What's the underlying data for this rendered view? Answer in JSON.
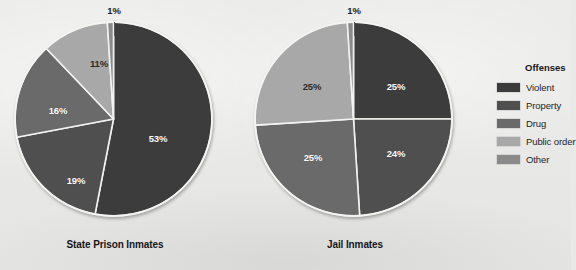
{
  "background_color": "#e9e9e7",
  "legend": {
    "title": "Offenses",
    "items": [
      {
        "label": "Violent",
        "color": "#3c3c3c"
      },
      {
        "label": "Property",
        "color": "#4f4f4f"
      },
      {
        "label": "Drug",
        "color": "#6a6a6a"
      },
      {
        "label": "Public order",
        "color": "#a8a8a8"
      },
      {
        "label": "Other",
        "color": "#8a8a8a"
      }
    ]
  },
  "chart_data": [
    {
      "type": "pie",
      "title": "State Prison Inmates",
      "categories": [
        "Violent",
        "Property",
        "Drug",
        "Public order",
        "Other"
      ],
      "values": [
        53,
        19,
        16,
        11,
        1
      ],
      "labels": [
        "53%",
        "19%",
        "16%",
        "11%",
        "1%"
      ],
      "colors": [
        "#3c3c3c",
        "#4f4f4f",
        "#6a6a6a",
        "#a8a8a8",
        "#8a8a8a"
      ],
      "units": "percent",
      "legend_position": "right",
      "grid": false,
      "start_angle_deg": 0,
      "direction": "clockwise"
    },
    {
      "type": "pie",
      "title": "Jail Inmates",
      "categories": [
        "Violent",
        "Property",
        "Drug",
        "Public order",
        "Other"
      ],
      "values": [
        25,
        24,
        25,
        25,
        1
      ],
      "labels": [
        "25%",
        "24%",
        "25%",
        "25%",
        "1%"
      ],
      "colors": [
        "#3c3c3c",
        "#4f4f4f",
        "#6a6a6a",
        "#a8a8a8",
        "#8a8a8a"
      ],
      "units": "percent",
      "legend_position": "right",
      "grid": false,
      "start_angle_deg": 0,
      "direction": "clockwise"
    }
  ],
  "charts": {
    "left": {
      "title": "State Prison Inmates",
      "slice_labels": {
        "violent": "53%",
        "property": "19%",
        "drug": "16%",
        "public_order": "11%",
        "other": "1%"
      }
    },
    "right": {
      "title": "Jail Inmates",
      "slice_labels": {
        "violent": "25%",
        "property": "24%",
        "drug": "25%",
        "public_order": "25%",
        "other": "1%"
      }
    }
  }
}
